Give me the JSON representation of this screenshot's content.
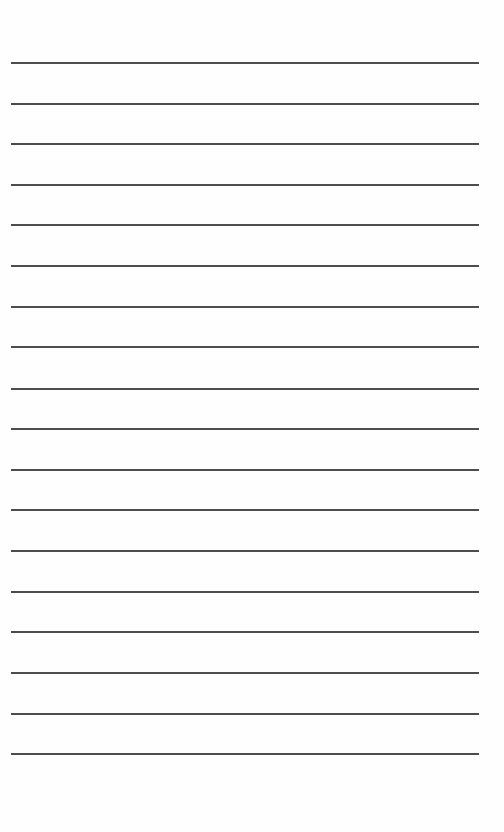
{
  "page": {
    "type": "lined-paper",
    "background": "#fefefe",
    "line_color": "#3a3a3a",
    "line_count": 18,
    "line_positions_y": [
      62,
      103,
      143,
      184,
      224,
      265,
      306,
      346,
      388,
      428,
      469,
      509,
      550,
      591,
      631,
      672,
      713,
      753
    ],
    "lines": [
      "",
      "",
      "",
      "",
      "",
      "",
      "",
      "",
      "",
      "",
      "",
      "",
      "",
      "",
      "",
      "",
      "",
      ""
    ]
  }
}
